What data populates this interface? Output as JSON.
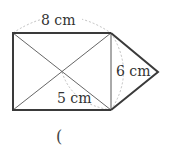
{
  "figure": {
    "shape": "rectangle with diagonals and attached triangle",
    "labels": {
      "top_width": "8 cm",
      "right_height": "6 cm",
      "half_diagonal": "5 cm"
    },
    "answer_paren": "(",
    "colors": {
      "outline": "#3a3a3a",
      "inner_lines": "#555555",
      "dashed": "#b0b0b0",
      "text": "#333333"
    }
  }
}
